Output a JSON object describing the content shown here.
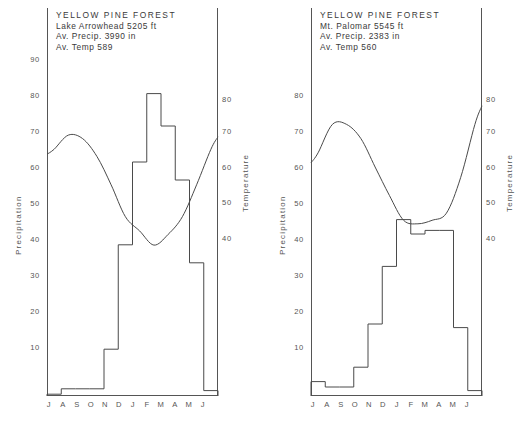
{
  "figure": {
    "background": "#ffffff",
    "line_color": "#4a4a4a",
    "text_color": "#3a3a3a"
  },
  "panels": [
    {
      "id": "lake-arrowhead",
      "header": {
        "title": "YELLOW PINE FOREST",
        "location": "Lake Arrowhead   5205 ft",
        "precip": "Av. Precip. 3990 in",
        "temp": "Av. Temp 589"
      },
      "y_left_label": "Precipitation",
      "y_right_label": "Temperature",
      "y_left_ticks": [
        "90",
        "80",
        "70",
        "60",
        "50",
        "40",
        "30",
        "20",
        "10"
      ],
      "y_right_ticks": [
        "80",
        "70",
        "60",
        "50",
        "40"
      ]
    },
    {
      "id": "mt-palomar",
      "header": {
        "title": "YELLOW PINE FOREST",
        "location": "Mt. Palomar  5545 ft",
        "precip": "Av. Precip. 2383 in",
        "temp": "Av. Temp 560"
      },
      "y_left_label": "Precipitation",
      "y_right_label": "Temperature",
      "y_left_ticks": [
        "80",
        "70",
        "60",
        "50",
        "40",
        "30",
        "20",
        "10"
      ],
      "y_right_ticks": [
        "80",
        "70",
        "60",
        "50",
        "40"
      ]
    }
  ],
  "months": [
    "J",
    "A",
    "S",
    "O",
    "N",
    "D",
    "J",
    "F",
    "M",
    "A",
    "M",
    "J"
  ],
  "chart_data": [
    {
      "type": "bar",
      "title": "YELLOW PINE FOREST — Lake Arrowhead 5205 ft",
      "subtitle": "Av. Precip. 3990 in / Av. Temp 589",
      "xlabel": "",
      "ylabel": "Precipitation",
      "y2label": "Temperature",
      "categories": [
        "J",
        "A",
        "S",
        "O",
        "N",
        "D",
        "J",
        "F",
        "M",
        "A",
        "M",
        "J"
      ],
      "grid": false,
      "legend": "none",
      "ylim": [
        0,
        95
      ],
      "y2lim": [
        33,
        87
      ],
      "yticks": [
        10,
        20,
        30,
        40,
        50,
        60,
        70,
        80,
        90
      ],
      "y2ticks": [
        40,
        50,
        60,
        70,
        80
      ],
      "series": [
        {
          "name": "Precipitation",
          "type": "step-bar",
          "axis": "left",
          "values": [
            0.5,
            2,
            2,
            2,
            13,
            42,
            65,
            84,
            75,
            60,
            37,
            1.5
          ]
        },
        {
          "name": "Temperature",
          "type": "line",
          "axis": "right",
          "values": [
            65,
            69,
            68,
            63,
            55,
            46,
            42,
            38,
            41,
            46,
            55,
            65
          ]
        }
      ]
    },
    {
      "type": "bar",
      "title": "YELLOW PINE FOREST — Mt. Palomar 5545 ft",
      "subtitle": "Av. Precip. 2383 in / Av. Temp 560",
      "xlabel": "",
      "ylabel": "Precipitation",
      "y2label": "Temperature",
      "categories": [
        "J",
        "A",
        "S",
        "O",
        "N",
        "D",
        "J",
        "F",
        "M",
        "A",
        "M",
        "J"
      ],
      "grid": false,
      "legend": "none",
      "ylim": [
        0,
        88
      ],
      "y2lim": [
        33,
        87
      ],
      "yticks": [
        10,
        20,
        30,
        40,
        50,
        60,
        70,
        80
      ],
      "y2ticks": [
        40,
        50,
        60,
        70,
        80
      ],
      "series": [
        {
          "name": "Precipitation",
          "type": "step-bar",
          "axis": "left",
          "values": [
            4,
            2.5,
            2.5,
            8,
            20,
            36,
            49,
            45,
            46,
            46,
            19,
            1.5
          ]
        },
        {
          "name": "Temperature",
          "type": "line",
          "axis": "right",
          "values": [
            64,
            72,
            72,
            68,
            60,
            52,
            45,
            44,
            45,
            47,
            57,
            72
          ]
        }
      ]
    }
  ]
}
